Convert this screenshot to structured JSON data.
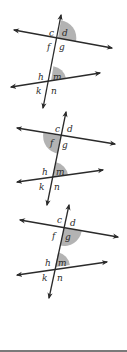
{
  "colors": {
    "line": "#2a2a2a",
    "shade": "#9a9a9a",
    "background": "#ffffff"
  },
  "labels": {
    "upper": [
      "c",
      "d",
      "f",
      "g"
    ],
    "lower": [
      "h",
      "m",
      "k",
      "n"
    ]
  },
  "diagrams": [
    {
      "id": "diagram-1",
      "shaded_angles": [
        "d",
        "m"
      ],
      "labels": {
        "c": "c",
        "d": "d",
        "f": "f",
        "g": "g",
        "h": "h",
        "m": "m",
        "k": "k",
        "n": "n"
      }
    },
    {
      "id": "diagram-2",
      "shaded_angles": [
        "f",
        "m"
      ],
      "labels": {
        "c": "c",
        "d": "d",
        "f": "f",
        "g": "g",
        "h": "h",
        "m": "m",
        "k": "k",
        "n": "n"
      }
    },
    {
      "id": "diagram-3",
      "shaded_angles": [
        "g",
        "m"
      ],
      "labels": {
        "c": "c",
        "d": "d",
        "f": "f",
        "g": "g",
        "h": "h",
        "m": "m",
        "k": "k",
        "n": "n"
      }
    }
  ]
}
